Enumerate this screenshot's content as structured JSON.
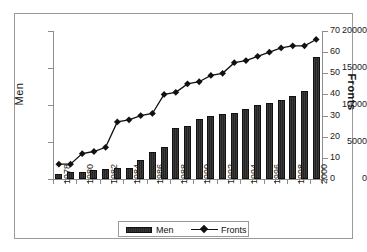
{
  "chart_data": {
    "type": "bar",
    "title": "",
    "xlabel": "",
    "ylabel": "Men",
    "y2label": "Fronts",
    "grid": false,
    "legend_position": "bottom",
    "ylim": [
      0,
      20000
    ],
    "y2lim": [
      0,
      70
    ],
    "yticks": [
      0,
      5000,
      10000,
      15000,
      20000
    ],
    "y2ticks": [
      0,
      10,
      20,
      30,
      40,
      50,
      60,
      70
    ],
    "categories": [
      "1978",
      "1979",
      "1980",
      "1981",
      "1982",
      "1983",
      "1984",
      "1985",
      "1986",
      "1987",
      "1988",
      "1989",
      "1990",
      "1991",
      "1992",
      "1993",
      "1994",
      "1995",
      "1996",
      "1997",
      "1998",
      "1999",
      "2000"
    ],
    "xtick_labels": [
      "1978",
      "1980",
      "1982",
      "1984",
      "1986",
      "1988",
      "1990",
      "1992",
      "1994",
      "1996",
      "1998",
      "2000"
    ],
    "series": [
      {
        "name": "Men",
        "type": "bar",
        "axis": "left",
        "values": [
          700,
          950,
          900,
          1150,
          1300,
          1550,
          1550,
          2550,
          3650,
          4300,
          6850,
          7150,
          8050,
          8500,
          8800,
          8900,
          9400,
          9950,
          10250,
          10700,
          11200,
          11900,
          16450
        ]
      },
      {
        "name": "Fronts",
        "type": "line",
        "axis": "right",
        "marker": "diamond",
        "values": [
          7,
          7,
          12,
          13,
          15,
          27,
          28,
          30,
          31,
          40,
          41,
          45,
          46,
          49,
          50,
          55,
          56,
          58,
          60,
          62,
          63,
          63,
          66
        ]
      }
    ]
  },
  "legend": {
    "items": [
      {
        "label": "Men",
        "marker": "bar-swatch"
      },
      {
        "label": "Fronts",
        "marker": "line-diamond"
      }
    ]
  },
  "axes": {
    "left_title": "Men",
    "right_title": "Fronts"
  }
}
